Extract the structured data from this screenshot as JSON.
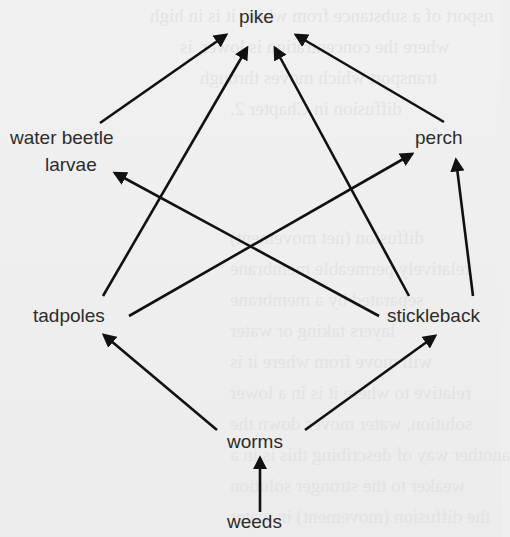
{
  "diagram": {
    "type": "food-web",
    "colors": {
      "background": "#efefef",
      "text": "#2c2c2c",
      "arrow": "#111111"
    },
    "nodes": {
      "pike": "pike",
      "water_beetle_larvae_line1": "water beetle",
      "water_beetle_larvae_line2": "larvae",
      "perch": "perch",
      "tadpoles": "tadpoles",
      "stickleback": "stickleback",
      "worms": "worms",
      "weeds": "weeds"
    },
    "edges": [
      {
        "from": "water beetle larvae",
        "to": "pike"
      },
      {
        "from": "tadpoles",
        "to": "pike"
      },
      {
        "from": "stickleback",
        "to": "pike"
      },
      {
        "from": "perch",
        "to": "pike"
      },
      {
        "from": "tadpoles",
        "to": "perch"
      },
      {
        "from": "stickleback",
        "to": "water beetle larvae"
      },
      {
        "from": "stickleback",
        "to": "perch"
      },
      {
        "from": "worms",
        "to": "tadpoles"
      },
      {
        "from": "worms",
        "to": "stickleback"
      },
      {
        "from": "weeds",
        "to": "worms"
      }
    ]
  }
}
